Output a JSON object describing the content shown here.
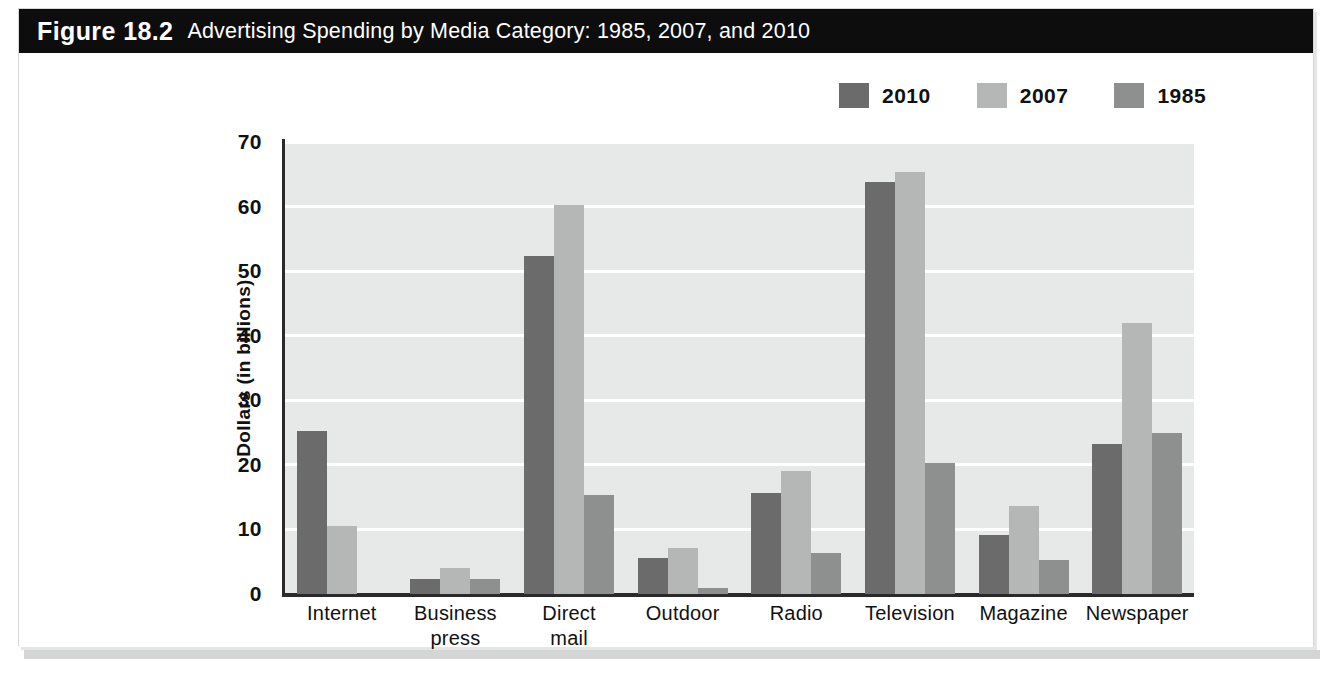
{
  "figure": {
    "number": "Figure 18.2",
    "title": "Advertising Spending by Media Category: 1985, 2007, and 2010"
  },
  "colors": {
    "series_2010": "#6b6b6b",
    "series_2007": "#b5b7b7",
    "series_1985": "#8e9090",
    "plot_background": "#e7e9e9",
    "gridline": "#ffffff",
    "axis": "#2a2a2a",
    "header_background": "#0d0d0d",
    "header_text": "#ffffff"
  },
  "legend": {
    "position": "top-right",
    "entries": [
      {
        "label": "2010",
        "color": "#6b6b6b"
      },
      {
        "label": "2007",
        "color": "#b5b7b7"
      },
      {
        "label": "1985",
        "color": "#8e9090"
      }
    ]
  },
  "chart_data": {
    "type": "bar",
    "title": "Advertising Spending by Media Category: 1985, 2007, and 2010",
    "xlabel": "",
    "ylabel": "Dollars (in billions)",
    "ylim": [
      0,
      70
    ],
    "yticks": [
      0,
      10,
      20,
      30,
      40,
      50,
      60,
      70
    ],
    "ytick_labels": [
      "0",
      "10",
      "20",
      "30",
      "40",
      "50",
      "60",
      "70"
    ],
    "grid": true,
    "grid_axis": "y",
    "legend_position": "top-right",
    "categories": [
      "Internet",
      "Business press",
      "Direct mail",
      "Outdoor",
      "Radio",
      "Television",
      "Magazine",
      "Newspaper"
    ],
    "category_lines": [
      [
        "Internet"
      ],
      [
        "Business",
        "press"
      ],
      [
        "Direct",
        "mail"
      ],
      [
        "Outdoor"
      ],
      [
        "Radio"
      ],
      [
        "Television"
      ],
      [
        "Magazine"
      ],
      [
        "Newspaper"
      ]
    ],
    "series": [
      {
        "name": "2010",
        "color": "#6b6b6b",
        "values": [
          25.3,
          2.4,
          52.3,
          5.6,
          15.6,
          63.8,
          9.2,
          23.2
        ]
      },
      {
        "name": "2007",
        "color": "#b5b7b7",
        "values": [
          10.5,
          4.1,
          60.2,
          7.2,
          19.1,
          65.3,
          13.6,
          42.0
        ]
      },
      {
        "name": "1985",
        "color": "#8e9090",
        "values": [
          null,
          2.4,
          15.4,
          0.9,
          6.3,
          20.3,
          5.2,
          24.9
        ]
      }
    ]
  }
}
